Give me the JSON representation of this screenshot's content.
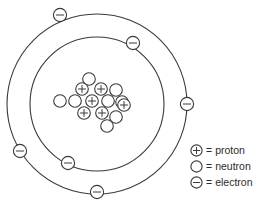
{
  "diagram": {
    "center": {
      "x": 97,
      "y": 104
    },
    "orbits": [
      {
        "name": "inner-orbit",
        "radius": 67,
        "electron_count": 2
      },
      {
        "name": "outer-orbit",
        "radius": 90,
        "electron_count": 4
      }
    ],
    "electrons": [
      {
        "label": "-",
        "x": 133,
        "y": 43,
        "orbit": "inner-orbit",
        "position": "upper-right"
      },
      {
        "label": "-",
        "x": 68,
        "y": 163,
        "orbit": "inner-orbit",
        "position": "lower-left"
      },
      {
        "label": "-",
        "x": 60,
        "y": 15,
        "orbit": "outer-orbit",
        "position": "top-left"
      },
      {
        "label": "-",
        "x": 20,
        "y": 151,
        "orbit": "outer-orbit",
        "position": "left-lower"
      },
      {
        "label": "-",
        "x": 187,
        "y": 104,
        "orbit": "outer-orbit",
        "position": "right"
      },
      {
        "label": "-",
        "x": 97,
        "y": 192,
        "orbit": "outer-orbit",
        "position": "bottom"
      }
    ],
    "nucleus": {
      "proton_count": 6,
      "neutron_count": 8,
      "particles": [
        {
          "type": "neutron",
          "label": "",
          "x": 89,
          "y": 79
        },
        {
          "type": "proton",
          "label": "+",
          "x": 82,
          "y": 89
        },
        {
          "type": "proton",
          "label": "+",
          "x": 101,
          "y": 89
        },
        {
          "type": "neutron",
          "label": "",
          "x": 116,
          "y": 90
        },
        {
          "type": "neutron",
          "label": "",
          "x": 75,
          "y": 101
        },
        {
          "type": "proton",
          "label": "+",
          "x": 92,
          "y": 101
        },
        {
          "type": "neutron",
          "label": "",
          "x": 108,
          "y": 101
        },
        {
          "type": "neutron",
          "label": "",
          "x": 122,
          "y": 102
        },
        {
          "type": "proton",
          "label": "+",
          "x": 84,
          "y": 113
        },
        {
          "type": "proton",
          "label": "+",
          "x": 102,
          "y": 113
        },
        {
          "type": "proton",
          "label": "+",
          "x": 124,
          "y": 105
        },
        {
          "type": "neutron",
          "label": "",
          "x": 116,
          "y": 117
        },
        {
          "type": "neutron",
          "label": "",
          "x": 107,
          "y": 126
        },
        {
          "type": "neutron",
          "label": "",
          "x": 60,
          "y": 101
        }
      ]
    }
  },
  "legend": {
    "name": "key",
    "equals_sign": "=",
    "items": [
      {
        "symbol": "+",
        "symbol_name": "proton-symbol",
        "label": "proton"
      },
      {
        "symbol": "",
        "symbol_name": "neutron-symbol",
        "label": "neutron"
      },
      {
        "symbol": "-",
        "symbol_name": "electron-symbol",
        "label": "electron"
      }
    ]
  },
  "colors": {
    "stroke": "#3a3a3a",
    "background": "#ffffff",
    "text": "#2b2b2b"
  }
}
